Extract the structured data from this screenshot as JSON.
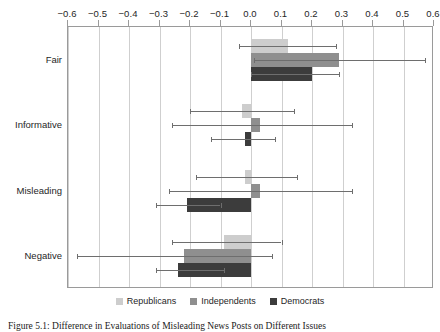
{
  "chart_data": {
    "type": "bar",
    "orientation": "horizontal",
    "title": "",
    "xlabel": "",
    "ylabel": "",
    "xlim": [
      -0.6,
      0.6
    ],
    "xticks": [
      -0.6,
      -0.5,
      -0.4,
      -0.3,
      -0.2,
      -0.1,
      0.0,
      0.1,
      0.2,
      0.3,
      0.4,
      0.5,
      0.6
    ],
    "xtick_labels": [
      "−0.6",
      "−0.5",
      "−0.4",
      "−0.3",
      "−0.2",
      "−0.1",
      "0.0",
      "0.1",
      "0.2",
      "0.3",
      "0.4",
      "0.5",
      "0.6"
    ],
    "xaxis_position": "top",
    "grid": true,
    "grid_axis": "x",
    "legend_position": "bottom",
    "categories": [
      "Fair",
      "Informative",
      "Misleading",
      "Negative"
    ],
    "series": [
      {
        "name": "Republicans",
        "color": "#cdcdcd",
        "values": [
          0.12,
          -0.03,
          -0.02,
          -0.09
        ],
        "ci_low": [
          -0.04,
          -0.2,
          -0.18,
          -0.26
        ],
        "ci_high": [
          0.28,
          0.14,
          0.15,
          0.1
        ]
      },
      {
        "name": "Independents",
        "color": "#8f8f8f",
        "values": [
          0.29,
          0.03,
          0.03,
          -0.22
        ],
        "ci_low": [
          0.01,
          -0.26,
          -0.27,
          -0.57
        ],
        "ci_high": [
          0.57,
          0.33,
          0.33,
          0.07
        ]
      },
      {
        "name": "Democrats",
        "color": "#3c3c3c",
        "values": [
          0.2,
          -0.02,
          -0.21,
          -0.24
        ],
        "ci_low": [
          0.0,
          -0.13,
          -0.31,
          -0.31
        ],
        "ci_high": [
          0.29,
          0.08,
          -0.1,
          -0.09
        ]
      }
    ],
    "legend": [
      "Republicans",
      "Independents",
      "Democrats"
    ]
  },
  "caption": {
    "text": "Figure 5.1: Difference in Evaluations of Misleading News Posts on Different Issues"
  }
}
